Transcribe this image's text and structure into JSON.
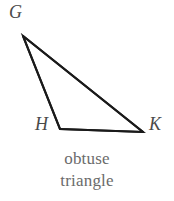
{
  "figure": {
    "kind": "geometry-diagram",
    "shape": "triangle",
    "background_color": "#ffffff",
    "stroke_color": "#1a1a1a",
    "stroke_width": 2,
    "label_color": "#4a4a4a",
    "caption_color": "#6b6b6b",
    "vertices": [
      {
        "name": "G",
        "label": "G",
        "x": 23,
        "y": 36,
        "label_x": 9,
        "label_y": 3
      },
      {
        "name": "H",
        "label": "H",
        "x": 60,
        "y": 129,
        "label_x": 35,
        "label_y": 115
      },
      {
        "name": "K",
        "label": "K",
        "x": 143,
        "y": 132,
        "label_x": 149,
        "label_y": 115
      }
    ],
    "edges": [
      {
        "name": "GH",
        "from": "G",
        "to": "H"
      },
      {
        "name": "GK",
        "from": "G",
        "to": "K"
      },
      {
        "name": "HK",
        "from": "H",
        "to": "K"
      }
    ],
    "path_points": "23,36 143,132 60,129 23,36",
    "caption": {
      "line1": "obtuse",
      "line2": "triangle"
    }
  }
}
